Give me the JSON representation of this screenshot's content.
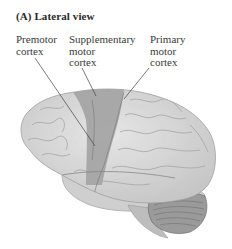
{
  "figure": {
    "panel_title": "(A)  Lateral view",
    "labels": [
      {
        "id": "premotor",
        "lines": [
          "Premotor",
          "cortex"
        ]
      },
      {
        "id": "supplementary",
        "lines": [
          "Supplementary",
          "motor",
          "cortex"
        ]
      },
      {
        "id": "primary",
        "lines": [
          "Primary",
          "motor",
          "cortex"
        ]
      }
    ],
    "colors": {
      "brain_base": "#d9d9d9",
      "motor_region": "#9e9e9e",
      "cerebellum": "#8c8c8c",
      "leader_line": "#444444"
    }
  }
}
